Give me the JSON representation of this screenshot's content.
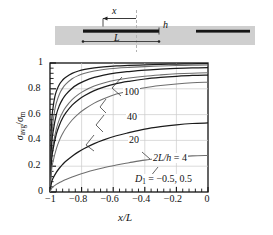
{
  "figure": {
    "schematic": {
      "name": "coplanar-strips-in-layer",
      "annotations": {
        "x_arrow": "x",
        "h_label": "h",
        "L_label": "L"
      },
      "band_color": "#cfcfcf",
      "strip_color": "#1a1a1a",
      "centerline_color": "#b0b0b0"
    },
    "axes": {
      "xlabel": "x/L",
      "ylabel_numerator": "σ",
      "ylabel_num_sub": "avg",
      "ylabel_denominator": "σ",
      "ylabel_den_sub": "m",
      "xticks": [
        "−1",
        "−0.8",
        "−0.6",
        "−0.4",
        "−0.2",
        "0"
      ],
      "xtick_values": [
        -1,
        -0.8,
        -0.6,
        -0.4,
        -0.2,
        0
      ],
      "yticks": [
        "0",
        "0.2",
        "0.4",
        "0.6",
        "0.8",
        "1"
      ],
      "ytick_values": [
        0,
        0.2,
        0.4,
        0.6,
        0.8,
        1
      ],
      "xlim": [
        -1,
        0
      ],
      "ylim": [
        0,
        1
      ],
      "grid": true,
      "minor_ticks": true
    },
    "curve_labels": [
      {
        "text": "100",
        "x": 0.555,
        "y": 0.805
      },
      {
        "text": "40",
        "x": 0.565,
        "y": 0.615
      },
      {
        "text": "20",
        "x": 0.575,
        "y": 0.435
      }
    ],
    "annotations": [
      {
        "text_pre": "2L/h",
        "text_eq": " = ",
        "text_val": "4",
        "x": 0.8,
        "y": 0.265
      },
      {
        "text_pre": "D",
        "sub": "1",
        "text_eq": " = ",
        "text_val": "−0.5, 0.5",
        "x": 0.79,
        "y": 0.075
      }
    ]
  },
  "chart_data": {
    "type": "line",
    "title": "",
    "xlabel": "x/L",
    "ylabel": "σavg/σm",
    "xlim": [
      -1,
      0
    ],
    "ylim": [
      0,
      1
    ],
    "grid": true,
    "legend_position": "inline-curve-labels",
    "annotations": [
      "2L/h = 4",
      "D1 = −0.5, 0.5"
    ],
    "series": [
      {
        "name": "2L/h = 100, D1 = -0.5",
        "label": "100",
        "x": [
          -1.0,
          -0.99,
          -0.98,
          -0.97,
          -0.96,
          -0.94,
          -0.92,
          -0.9,
          -0.86,
          -0.82,
          -0.78,
          -0.72,
          -0.66,
          -0.58,
          -0.5,
          -0.4,
          -0.3,
          -0.2,
          -0.1,
          0.0
        ],
        "values": [
          0.0,
          0.52,
          0.66,
          0.735,
          0.78,
          0.835,
          0.868,
          0.89,
          0.92,
          0.938,
          0.95,
          0.962,
          0.97,
          0.977,
          0.981,
          0.986,
          0.989,
          0.992,
          0.994,
          0.995
        ]
      },
      {
        "name": "2L/h = 100, D1 = 0.5",
        "label": "100",
        "x": [
          -1.0,
          -0.99,
          -0.98,
          -0.97,
          -0.96,
          -0.94,
          -0.92,
          -0.9,
          -0.86,
          -0.82,
          -0.78,
          -0.72,
          -0.66,
          -0.58,
          -0.5,
          -0.4,
          -0.3,
          -0.2,
          -0.1,
          0.0
        ],
        "values": [
          0.0,
          0.4,
          0.55,
          0.635,
          0.69,
          0.76,
          0.805,
          0.836,
          0.878,
          0.903,
          0.92,
          0.938,
          0.95,
          0.96,
          0.966,
          0.972,
          0.977,
          0.98,
          0.983,
          0.984
        ]
      },
      {
        "name": "2L/h = 40, D1 = -0.5",
        "label": "40",
        "x": [
          -1.0,
          -0.99,
          -0.98,
          -0.96,
          -0.94,
          -0.92,
          -0.9,
          -0.86,
          -0.82,
          -0.78,
          -0.72,
          -0.66,
          -0.58,
          -0.5,
          -0.4,
          -0.3,
          -0.2,
          -0.1,
          0.0
        ],
        "values": [
          0.0,
          0.355,
          0.47,
          0.6,
          0.672,
          0.72,
          0.755,
          0.805,
          0.838,
          0.862,
          0.888,
          0.906,
          0.923,
          0.934,
          0.945,
          0.952,
          0.958,
          0.962,
          0.964
        ]
      },
      {
        "name": "2L/h = 40, D1 = 0.5",
        "label": "40",
        "x": [
          -1.0,
          -0.99,
          -0.98,
          -0.96,
          -0.94,
          -0.92,
          -0.9,
          -0.86,
          -0.82,
          -0.78,
          -0.72,
          -0.66,
          -0.58,
          -0.5,
          -0.4,
          -0.3,
          -0.2,
          -0.1,
          0.0
        ],
        "values": [
          0.0,
          0.27,
          0.37,
          0.49,
          0.565,
          0.618,
          0.658,
          0.716,
          0.757,
          0.787,
          0.821,
          0.845,
          0.868,
          0.883,
          0.898,
          0.908,
          0.916,
          0.921,
          0.924
        ]
      },
      {
        "name": "2L/h = 20, D1 = -0.5",
        "label": "20",
        "x": [
          -1.0,
          -0.99,
          -0.98,
          -0.96,
          -0.94,
          -0.92,
          -0.9,
          -0.86,
          -0.82,
          -0.78,
          -0.72,
          -0.66,
          -0.58,
          -0.5,
          -0.4,
          -0.3,
          -0.2,
          -0.1,
          0.0
        ],
        "values": [
          0.0,
          0.245,
          0.335,
          0.448,
          0.52,
          0.573,
          0.613,
          0.673,
          0.716,
          0.748,
          0.786,
          0.813,
          0.84,
          0.858,
          0.876,
          0.888,
          0.897,
          0.904,
          0.907
        ]
      },
      {
        "name": "2L/h = 20, D1 = 0.5",
        "label": "20",
        "x": [
          -1.0,
          -0.99,
          -0.98,
          -0.96,
          -0.94,
          -0.92,
          -0.9,
          -0.86,
          -0.82,
          -0.78,
          -0.72,
          -0.66,
          -0.58,
          -0.5,
          -0.4,
          -0.3,
          -0.2,
          -0.1,
          0.0
        ],
        "values": [
          0.0,
          0.17,
          0.24,
          0.335,
          0.402,
          0.453,
          0.494,
          0.558,
          0.606,
          0.643,
          0.689,
          0.723,
          0.759,
          0.783,
          0.808,
          0.825,
          0.838,
          0.847,
          0.851
        ]
      },
      {
        "name": "2L/h = 4, D1 = -0.5",
        "label": "4",
        "x": [
          -1.0,
          -0.99,
          -0.98,
          -0.96,
          -0.94,
          -0.92,
          -0.9,
          -0.86,
          -0.82,
          -0.78,
          -0.72,
          -0.66,
          -0.58,
          -0.5,
          -0.4,
          -0.3,
          -0.2,
          -0.1,
          0.0
        ],
        "values": [
          0.0,
          0.075,
          0.108,
          0.152,
          0.186,
          0.214,
          0.238,
          0.278,
          0.311,
          0.339,
          0.375,
          0.404,
          0.436,
          0.46,
          0.487,
          0.506,
          0.521,
          0.531,
          0.535
        ]
      },
      {
        "name": "2L/h = 4, D1 = 0.5",
        "label": "4",
        "x": [
          -1.0,
          -0.99,
          -0.98,
          -0.96,
          -0.94,
          -0.92,
          -0.9,
          -0.86,
          -0.82,
          -0.78,
          -0.72,
          -0.66,
          -0.58,
          -0.5,
          -0.4,
          -0.3,
          -0.2,
          -0.1,
          0.0
        ],
        "values": [
          0.0,
          0.028,
          0.041,
          0.059,
          0.073,
          0.086,
          0.097,
          0.117,
          0.134,
          0.149,
          0.17,
          0.188,
          0.21,
          0.227,
          0.247,
          0.261,
          0.272,
          0.28,
          0.283
        ]
      }
    ]
  }
}
